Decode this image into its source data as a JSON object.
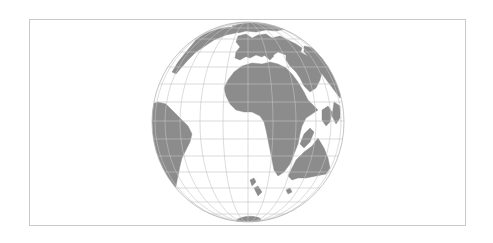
{
  "map": {
    "type": "orthographic-globe",
    "frame": {
      "x": 29,
      "y": 19,
      "width": 437,
      "height": 207,
      "border_color": "#c9c9c9"
    },
    "globe": {
      "cx": 248,
      "cy": 122,
      "rx": 96,
      "ry": 100
    },
    "colors": {
      "ocean": "#ffffff",
      "land": "#8c8c8c",
      "graticule": "#c4c4c4",
      "outline": "#b5b5b5"
    },
    "graticule": {
      "parallel_step_deg": 15,
      "meridian_step_deg": 15
    },
    "visible_landmasses": [
      "Africa",
      "Europe",
      "Arabia / Middle East",
      "South America",
      "Greenland / North America (edge)",
      "Madagascar",
      "Australia",
      "New Zealand",
      "Antarctica (edge)"
    ]
  }
}
